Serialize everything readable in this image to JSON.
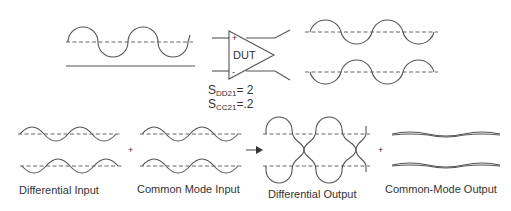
{
  "top": {
    "dut_label": "DUT",
    "plus_sign": "+",
    "minus_sign": "-",
    "params": [
      {
        "prefix": "S",
        "sub": "DD21",
        "value": "= 2"
      },
      {
        "prefix": "S",
        "sub": "CC21",
        "value": "=.2"
      }
    ]
  },
  "bottom": {
    "labels": {
      "differential_input": "Differential Input",
      "common_mode_input": "Common Mode Input",
      "differential_output": "Differential Output",
      "common_mode_output": "Common-Mode Output"
    },
    "operators": {
      "plus1": "+",
      "plus2": "+"
    }
  },
  "colors": {
    "stroke": "#555555",
    "dashed": "#666666",
    "text": "#333333",
    "background": "#ffffff"
  }
}
